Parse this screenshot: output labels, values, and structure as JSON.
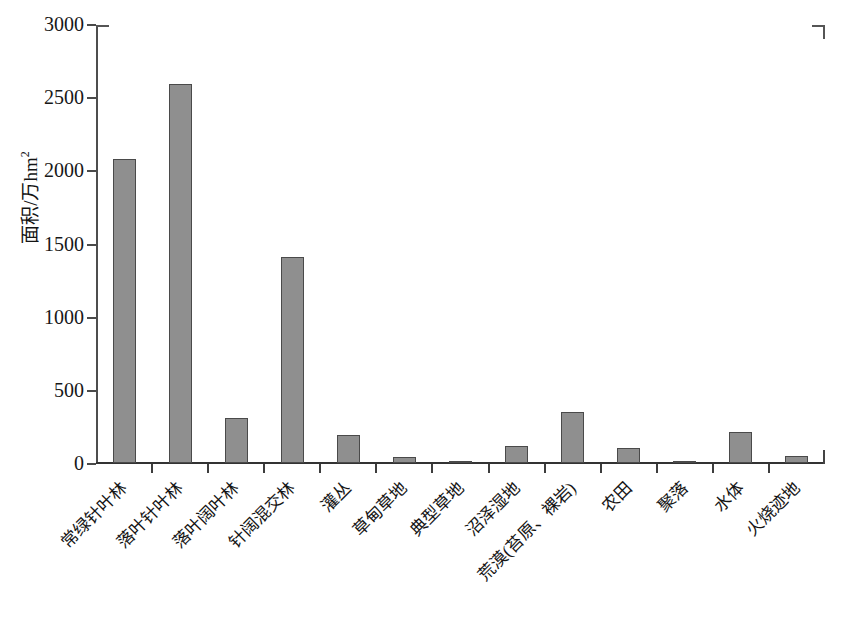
{
  "chart_data": {
    "type": "bar",
    "title": "",
    "xlabel": "",
    "ylabel": "面积/万hm²",
    "ylim": [
      0,
      3000
    ],
    "ytick_values": [
      0,
      500,
      1000,
      1500,
      2000,
      2500,
      3000
    ],
    "ytick_labels": [
      "0",
      "500",
      "1000",
      "1500",
      "2000",
      "2500",
      "3000"
    ],
    "grid": false,
    "legend": "none",
    "bar_color": "#8f8f8f",
    "bar_edge_color": "#4a4a4a",
    "categories": [
      "常绿针叶林",
      "落叶针叶林",
      "落叶阔叶林",
      "针阔混交林",
      "灌丛",
      "草甸草地",
      "典型草地",
      "沼泽湿地",
      "荒漠(苔原、裸岩)",
      "农田",
      "聚落",
      "水体",
      "火烧迹地"
    ],
    "values": [
      2078,
      2590,
      308,
      1408,
      191,
      40,
      10,
      118,
      352,
      105,
      10,
      210,
      48
    ]
  },
  "axis": {
    "ylabel_main": "面积/万hm",
    "ylabel_exponent": "2"
  },
  "caption": ""
}
